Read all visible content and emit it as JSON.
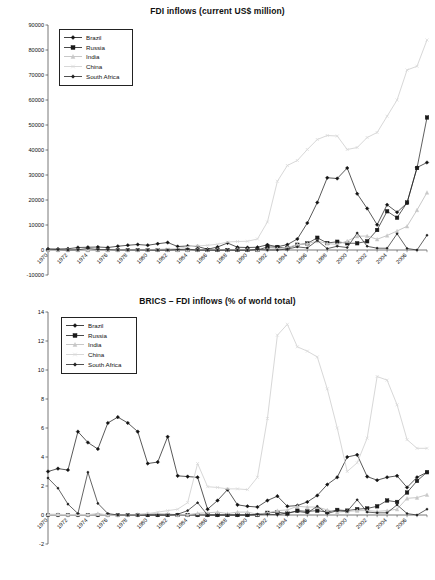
{
  "figure": {
    "background": "#ffffff",
    "series_colors": {
      "Brazil": "#111111",
      "Russia": "#1a1a1a",
      "India": "#c8c8c8",
      "China": "#d8d8d8",
      "South Africa": "#222222"
    }
  },
  "legend": {
    "entries": [
      {
        "label": "Brazil",
        "marker": "diamond",
        "color": "#111111"
      },
      {
        "label": "Russia",
        "marker": "square",
        "color": "#1a1a1a"
      },
      {
        "label": "India",
        "marker": "triangle",
        "color": "#c8c8c8"
      },
      {
        "label": "China",
        "marker": "cross",
        "color": "#d8d8d8"
      },
      {
        "label": "South Africa",
        "marker": "star",
        "color": "#222222"
      }
    ]
  },
  "chart_data": [
    {
      "type": "line",
      "title": "FDI inflows (current US$ million)",
      "xlabel": "",
      "ylabel": "",
      "ylim": [
        -10000,
        90000
      ],
      "ytick_step": 10000,
      "yticks": [
        -10000,
        0,
        10000,
        20000,
        30000,
        40000,
        50000,
        60000,
        70000,
        80000,
        90000
      ],
      "grid": false,
      "legend_position": "top-left",
      "x": [
        1970,
        1971,
        1972,
        1973,
        1974,
        1975,
        1976,
        1977,
        1978,
        1979,
        1980,
        1981,
        1982,
        1983,
        1984,
        1985,
        1986,
        1987,
        1988,
        1989,
        1990,
        1991,
        1992,
        1993,
        1994,
        1995,
        1996,
        1997,
        1998,
        1999,
        2000,
        2001,
        2002,
        2003,
        2004,
        2005,
        2006,
        2007,
        2008
      ],
      "xtick_labels": [
        "1970",
        "1972",
        "1974",
        "1976",
        "1978",
        "1980",
        "1982",
        "1984",
        "1986",
        "1988",
        "1990",
        "1992",
        "1994",
        "1996",
        "1998",
        "2000",
        "2002",
        "2004",
        "2006"
      ],
      "series": [
        {
          "name": "Brazil",
          "marker": "diamond",
          "color": "#111111",
          "values": [
            392,
            407,
            489,
            1004,
            1104,
            1156,
            1010,
            1458,
            1894,
            2228,
            1911,
            2522,
            2957,
            1375,
            1556,
            1418,
            320,
            1225,
            2804,
            1131,
            989,
            1102,
            2061,
            1291,
            2150,
            4405,
            10792,
            18993,
            28856,
            28578,
            32779,
            22457,
            16590,
            10144,
            18146,
            15066,
            18822,
            34585,
            45058
          ]
        },
        {
          "name": "Russia",
          "marker": "square",
          "color": "#1a1a1a",
          "values": [
            0,
            0,
            0,
            0,
            0,
            0,
            0,
            0,
            0,
            0,
            0,
            0,
            0,
            0,
            0,
            0,
            0,
            0,
            0,
            0,
            0,
            0,
            1161,
            1211,
            690,
            2065,
            2579,
            4865,
            2761,
            3309,
            2714,
            2748,
            3461,
            7958,
            15444,
            12886,
            29701,
            55073,
            75002
          ]
        },
        {
          "name": "India",
          "marker": "triangle",
          "color": "#c8c8c8",
          "values": [
            45,
            45,
            18,
            39,
            19,
            84,
            0,
            0,
            18,
            49,
            79,
            92,
            72,
            6,
            19,
            106,
            118,
            212,
            91,
            252,
            237,
            75,
            252,
            532,
            974,
            2151,
            2525,
            3619,
            2633,
            2168,
            3588,
            5478,
            5630,
            4321,
            5778,
            7622,
            20328,
            25127,
            40418
          ]
        },
        {
          "name": "China",
          "marker": "cross",
          "color": "#d8d8d8",
          "values": [
            0,
            0,
            0,
            0,
            0,
            0,
            0,
            0,
            0,
            0,
            57,
            265,
            430,
            636,
            1258,
            1659,
            1875,
            2314,
            3194,
            3393,
            3487,
            4366,
            11156,
            27515,
            33787,
            35849,
            40180,
            44237,
            43751,
            38753,
            38399,
            44241,
            49308,
            47077,
            54936,
            79127,
            78095,
            138413,
            147791
          ]
        },
        {
          "name": "South Africa",
          "marker": "star",
          "color": "#222222",
          "values": [
            318,
            148,
            9,
            79,
            617,
            181,
            140,
            -15,
            -20,
            -99,
            -24,
            -3,
            -50,
            170,
            350,
            -312,
            -59,
            -26,
            -80,
            -30,
            -78,
            254,
            22,
            12,
            374,
            1248,
            816,
            3811,
            550,
            1503,
            969,
            6789,
            1479,
            733,
            701,
            6522,
            623,
            5695,
            9009
          ]
        }
      ],
      "annotations": {
        "peak_china": {
          "year": 2008,
          "value": 84000,
          "note": "China rises steeply from 1992"
        },
        "peak_brazil": {
          "year": 2000,
          "value": 33000
        },
        "final_russia": {
          "year": 2008,
          "value": 53000
        },
        "final_brazil": {
          "year": 2008,
          "value": 35000
        },
        "final_india": {
          "year": 2008,
          "value": 23000
        }
      },
      "plot_values_normalized_note": "Rendered series are the plotted display values below",
      "display_series": [
        {
          "name": "Brazil",
          "values": [
            400,
            400,
            500,
            1000,
            1100,
            1200,
            1000,
            1500,
            1900,
            2200,
            1900,
            2500,
            3000,
            1400,
            1600,
            1400,
            300,
            1200,
            2800,
            1100,
            1000,
            1100,
            2100,
            1300,
            2150,
            4400,
            10800,
            19000,
            28900,
            28600,
            32800,
            22500,
            16600,
            10100,
            18100,
            15100,
            18800,
            33000,
            35000
          ]
        },
        {
          "name": "Russia",
          "values": [
            0,
            0,
            0,
            0,
            0,
            0,
            0,
            0,
            0,
            0,
            0,
            0,
            0,
            0,
            0,
            0,
            0,
            0,
            0,
            0,
            0,
            0,
            1200,
            1200,
            700,
            2100,
            2600,
            4900,
            2800,
            3300,
            2700,
            2700,
            3500,
            8000,
            15500,
            12900,
            19000,
            32800,
            53000
          ]
        },
        {
          "name": "India",
          "values": [
            50,
            50,
            20,
            40,
            20,
            80,
            0,
            0,
            20,
            50,
            80,
            90,
            70,
            10,
            20,
            100,
            120,
            210,
            90,
            250,
            240,
            80,
            250,
            530,
            970,
            2150,
            2500,
            3600,
            2600,
            2200,
            3600,
            5500,
            5600,
            4300,
            5800,
            7600,
            9500,
            16000,
            23000
          ]
        },
        {
          "name": "China",
          "values": [
            0,
            0,
            0,
            0,
            0,
            0,
            0,
            0,
            0,
            0,
            100,
            300,
            450,
            650,
            1260,
            1660,
            1880,
            2310,
            3200,
            3400,
            3500,
            4400,
            11200,
            27500,
            33800,
            35800,
            40200,
            44200,
            45800,
            45600,
            40200,
            41000,
            45000,
            47000,
            53500,
            60000,
            72000,
            73500,
            84000
          ]
        },
        {
          "name": "South Africa",
          "values": [
            320,
            150,
            10,
            80,
            620,
            180,
            140,
            0,
            0,
            0,
            0,
            0,
            0,
            170,
            350,
            0,
            0,
            0,
            0,
            0,
            0,
            250,
            20,
            10,
            370,
            1250,
            820,
            3800,
            550,
            1500,
            970,
            6800,
            1480,
            730,
            700,
            6500,
            620,
            0,
            5900
          ]
        }
      ]
    },
    {
      "type": "line",
      "title": "BRICS – FDI inflows (% of world total)",
      "xlabel": "",
      "ylabel": "",
      "ylim": [
        -2,
        14
      ],
      "ytick_step": 2,
      "yticks": [
        -2,
        0,
        2,
        4,
        6,
        8,
        10,
        12,
        14
      ],
      "grid": false,
      "legend_position": "top-left",
      "x": [
        1970,
        1971,
        1972,
        1973,
        1974,
        1975,
        1976,
        1977,
        1978,
        1979,
        1980,
        1981,
        1982,
        1983,
        1984,
        1985,
        1986,
        1987,
        1988,
        1989,
        1990,
        1991,
        1992,
        1993,
        1994,
        1995,
        1996,
        1997,
        1998,
        1999,
        2000,
        2001,
        2002,
        2003,
        2004,
        2005,
        2006,
        2007,
        2008
      ],
      "xtick_labels": [
        "1970",
        "1972",
        "1974",
        "1976",
        "1978",
        "1980",
        "1982",
        "1984",
        "1986",
        "1988",
        "1990",
        "1992",
        "1994",
        "1996",
        "1998",
        "2000",
        "2002",
        "2004",
        "2006"
      ],
      "series": [
        {
          "name": "Brazil",
          "marker": "diamond",
          "color": "#111111",
          "values": [
            3.0,
            3.2,
            3.1,
            5.75,
            5.0,
            4.55,
            6.35,
            6.75,
            6.35,
            5.75,
            3.55,
            3.65,
            5.4,
            2.7,
            2.65,
            2.6,
            0.4,
            1.0,
            1.75,
            0.7,
            0.6,
            0.55,
            1.0,
            1.3,
            0.6,
            0.65,
            0.9,
            1.35,
            2.1,
            2.6,
            4.0,
            4.15,
            2.65,
            2.4,
            2.6,
            2.7,
            1.9,
            2.6,
            2.95
          ]
        },
        {
          "name": "Russia",
          "marker": "square",
          "color": "#1a1a1a",
          "values": [
            0,
            0,
            0,
            0,
            0,
            0,
            0,
            0,
            0,
            0,
            0,
            0,
            0,
            0,
            0,
            0,
            0,
            0,
            0,
            0,
            0,
            0,
            0.15,
            0.2,
            0.1,
            0.3,
            0.25,
            0.3,
            0.2,
            0.35,
            0.3,
            0.4,
            0.45,
            0.6,
            1.0,
            0.9,
            1.55,
            2.35,
            2.95
          ]
        },
        {
          "name": "India",
          "marker": "triangle",
          "color": "#c8c8c8",
          "values": [
            0.05,
            0.05,
            0.02,
            0.05,
            0.02,
            0.1,
            0,
            0,
            0.02,
            0.05,
            0.1,
            0.1,
            0.08,
            0.01,
            0.02,
            0.12,
            0.15,
            0.2,
            0.1,
            0.2,
            0.2,
            0.05,
            0.15,
            0.3,
            0.35,
            0.6,
            0.55,
            0.55,
            0.35,
            0.2,
            0.25,
            0.3,
            0.3,
            0.25,
            0.3,
            0.4,
            1.15,
            1.2,
            1.4
          ]
        },
        {
          "name": "China",
          "marker": "cross",
          "color": "#d8d8d8",
          "values": [
            0,
            0,
            0,
            0,
            0,
            0,
            0,
            0,
            0,
            0,
            0.1,
            0.2,
            0.3,
            0.4,
            0.85,
            3.55,
            1.95,
            1.9,
            1.8,
            1.8,
            1.75,
            2.6,
            6.65,
            12.4,
            13.15,
            11.6,
            11.3,
            10.9,
            8.7,
            6.0,
            3.0,
            3.6,
            5.3,
            9.55,
            9.3,
            7.6,
            5.2,
            4.6,
            4.6
          ]
        },
        {
          "name": "South Africa",
          "marker": "star",
          "color": "#222222",
          "values": [
            2.55,
            1.85,
            0.75,
            0.1,
            2.95,
            0.8,
            0.1,
            0,
            0,
            0,
            0,
            0,
            0,
            0.05,
            0.3,
            0.85,
            0,
            0,
            0,
            0,
            0,
            0.05,
            0.05,
            0.02,
            0.15,
            0.25,
            0.15,
            0.6,
            0.1,
            0.3,
            0.25,
            1.05,
            0.2,
            0.15,
            0.15,
            0.7,
            0.1,
            0,
            0.4
          ]
        }
      ],
      "annotations": {
        "peak_china_1994": {
          "year": 1994,
          "value": 13.15
        },
        "trough_china_2000": {
          "year": 2000,
          "value": 3.0
        },
        "peak_china_2003": {
          "year": 2003,
          "value": 9.55
        },
        "peak_brazil_1977": {
          "year": 1977,
          "value": 6.75
        },
        "peak_brazil_2001": {
          "year": 2001,
          "value": 4.15
        }
      }
    }
  ]
}
